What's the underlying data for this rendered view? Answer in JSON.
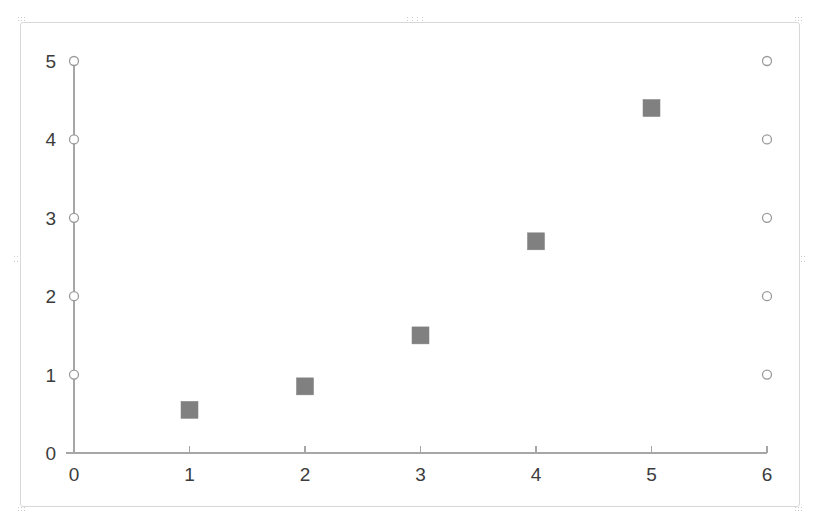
{
  "object": {
    "name": "embedded-chart-object",
    "selected": true,
    "handles": [
      "top-left",
      "top-center",
      "top-right",
      "middle-left",
      "middle-right",
      "bottom-left",
      "bottom-right"
    ],
    "border_color": "#d8d8d8",
    "background": "#ffffff"
  },
  "chart_data": {
    "type": "scatter",
    "title": "",
    "xlabel": "",
    "ylabel": "",
    "xlim": [
      0,
      6
    ],
    "ylim": [
      0,
      5
    ],
    "xticks": [
      0,
      1,
      2,
      3,
      4,
      5,
      6
    ],
    "yticks": [
      0,
      1,
      2,
      3,
      4,
      5
    ],
    "xtick_labels": [
      "0",
      "1",
      "2",
      "3",
      "4",
      "5",
      "6"
    ],
    "ytick_labels": [
      "0",
      "1",
      "2",
      "3",
      "4",
      "5"
    ],
    "grid": false,
    "legend": "none",
    "axis_color": "#a6a6a6",
    "series": [
      {
        "name": "data-squares",
        "marker": "square",
        "color": "#808080",
        "fill": "#808080",
        "size": 17,
        "points": [
          {
            "x": 1,
            "y": 0.55
          },
          {
            "x": 2,
            "y": 0.85
          },
          {
            "x": 3,
            "y": 1.5
          },
          {
            "x": 4,
            "y": 2.7
          },
          {
            "x": 5,
            "y": 4.4
          }
        ]
      },
      {
        "name": "left-open-circles",
        "marker": "circle-open",
        "color": "#9a9a9a",
        "fill": "#ffffff",
        "size": 9,
        "points": [
          {
            "x": 0,
            "y": 1
          },
          {
            "x": 0,
            "y": 2
          },
          {
            "x": 0,
            "y": 3
          },
          {
            "x": 0,
            "y": 4
          },
          {
            "x": 0,
            "y": 5
          }
        ]
      },
      {
        "name": "right-open-circles",
        "marker": "circle-open",
        "color": "#9a9a9a",
        "fill": "#ffffff",
        "size": 9,
        "points": [
          {
            "x": 6,
            "y": 1
          },
          {
            "x": 6,
            "y": 2
          },
          {
            "x": 6,
            "y": 3
          },
          {
            "x": 6,
            "y": 4
          },
          {
            "x": 6,
            "y": 5
          }
        ]
      }
    ]
  }
}
